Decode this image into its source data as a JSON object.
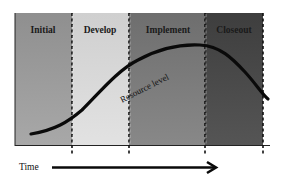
{
  "diagram": {
    "phases": [
      {
        "label": "Initial",
        "color": "#9a9a9a",
        "text_color": "#1a1a1a"
      },
      {
        "label": "Develop",
        "color": "#d6d6d6",
        "text_color": "#1a1a1a"
      },
      {
        "label": "Implement",
        "color": "#777777",
        "text_color": "#1a1a1a"
      },
      {
        "label": "Closeout",
        "color": "#4a4a4a",
        "text_color": "#1a1a1a"
      }
    ],
    "curve_label": "Resource level",
    "axis_label": "Time"
  }
}
